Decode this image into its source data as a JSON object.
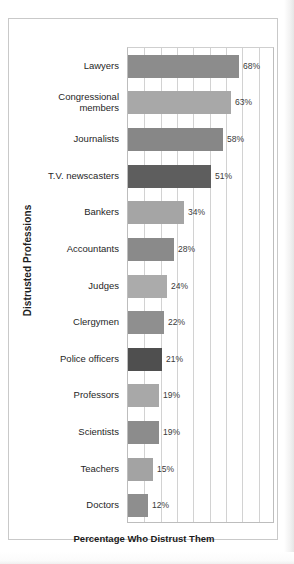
{
  "figure": {
    "y_axis_title": "Distrusted Professions",
    "x_axis_title": "Percentage Who Distrust Them"
  },
  "chart_data": {
    "type": "bar",
    "orientation": "horizontal",
    "title": "",
    "xlabel": "Percentage Who Distrust Them",
    "ylabel": "Distrusted Professions",
    "xlim": [
      0,
      90
    ],
    "grid": true,
    "grid_interval": 10,
    "legend": "none",
    "value_suffix": "%",
    "categories": [
      "Lawyers",
      "Congressional members",
      "Journalists",
      "T.V. newscasters",
      "Bankers",
      "Accountants",
      "Judges",
      "Clergymen",
      "Police officers",
      "Professors",
      "Scientists",
      "Teachers",
      "Doctors"
    ],
    "values": [
      68,
      63,
      58,
      51,
      34,
      28,
      24,
      22,
      21,
      19,
      19,
      15,
      12
    ],
    "value_labels": [
      "68%",
      "63%",
      "58%",
      "51%",
      "34%",
      "28%",
      "24%",
      "22%",
      "21%",
      "19%",
      "19%",
      "15%",
      "12%"
    ],
    "bar_colors": [
      "#8c8c8c",
      "#a8a8a8",
      "#878787",
      "#5e5e5e",
      "#a5a5a5",
      "#8a8a8a",
      "#ababab",
      "#8f8f8f",
      "#4f4f4f",
      "#a8a8a8",
      "#8c8c8c",
      "#a3a3a3",
      "#8e8e8e"
    ],
    "label_lines": [
      [
        "Lawyers"
      ],
      [
        "Congressional",
        "members"
      ],
      [
        "Journalists"
      ],
      [
        "T.V. newscasters"
      ],
      [
        "Bankers"
      ],
      [
        "Accountants"
      ],
      [
        "Judges"
      ],
      [
        "Clergymen"
      ],
      [
        "Police officers"
      ],
      [
        "Professors"
      ],
      [
        "Scientists"
      ],
      [
        "Teachers"
      ],
      [
        "Doctors"
      ]
    ]
  }
}
